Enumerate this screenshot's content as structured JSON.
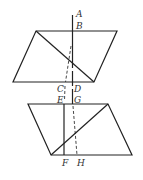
{
  "labels": {
    "A": "A",
    "B": "B",
    "C": "C",
    "D": "D",
    "E": "E",
    "G": "G",
    "F": "F",
    "H": "H"
  }
}
